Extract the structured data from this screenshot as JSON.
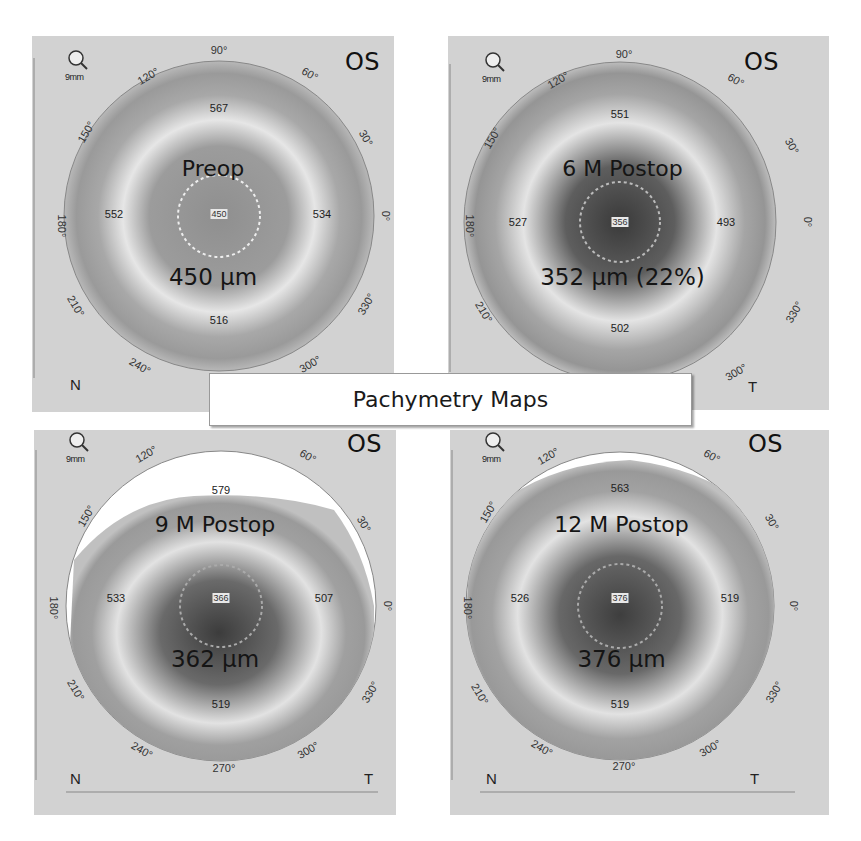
{
  "banner": {
    "title": "Pachymetry Maps"
  },
  "common": {
    "eye": "OS",
    "zoom_label": "9mm",
    "nasal": "N",
    "temporal": "T",
    "degree_labels": [
      "0°",
      "30°",
      "60°",
      "90°",
      "120°",
      "150°",
      "180°",
      "210°",
      "240°",
      "270°",
      "300°",
      "330°"
    ]
  },
  "panels": [
    {
      "title": "Preop",
      "cct": "450 µm",
      "center": "450",
      "superior": "567",
      "inferior": "516",
      "nasal_val": "552",
      "temporal_val": "534",
      "show_temporal_label": false
    },
    {
      "title": "6 M Postop",
      "cct": "352 µm (22%)",
      "center": "356",
      "superior": "551",
      "inferior": "502",
      "nasal_val": "527",
      "temporal_val": "493",
      "show_temporal_label": true
    },
    {
      "title": "9 M Postop",
      "cct": "362 µm",
      "center": "366",
      "superior": "579",
      "inferior": "519",
      "nasal_val": "533",
      "temporal_val": "507",
      "show_temporal_label": true
    },
    {
      "title": "12 M Postop",
      "cct": "376 µm",
      "center": "376",
      "superior": "563",
      "inferior": "519",
      "nasal_val": "526",
      "temporal_val": "519",
      "show_temporal_label": true
    }
  ]
}
